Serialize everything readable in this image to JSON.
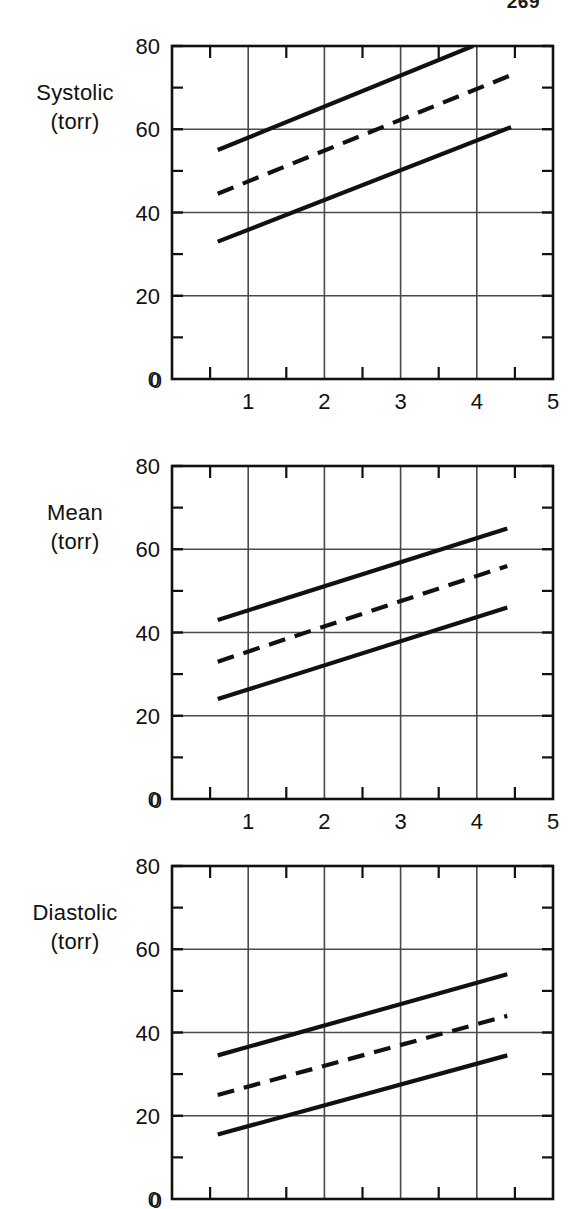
{
  "page": {
    "number": "269"
  },
  "figure": {
    "panel_count": 3
  },
  "chart_data": [
    {
      "type": "line",
      "title": "Systolic",
      "ylabel_lines": [
        "Systolic",
        "(torr)"
      ],
      "ylabel": "Systolic (torr)",
      "xlabel": "",
      "xlim": [
        0,
        5
      ],
      "ylim": [
        0,
        80
      ],
      "xticks": [
        0,
        1,
        2,
        3,
        4,
        5
      ],
      "xtick_labels": [
        "0",
        "1",
        "2",
        "3",
        "4",
        "5"
      ],
      "xminor_ticks": [
        0.5,
        1.5,
        2.5,
        3.5,
        4.5
      ],
      "yticks": [
        0,
        20,
        40,
        60,
        80
      ],
      "ytick_labels": [
        "0",
        "20",
        "40",
        "60",
        "80"
      ],
      "yminor_ticks": [
        10,
        30,
        50,
        70
      ],
      "grid": true,
      "legend": "none",
      "series": [
        {
          "name": "upper-limit",
          "style": "solid",
          "x": [
            0.6,
            3.95
          ],
          "values": [
            55,
            80
          ]
        },
        {
          "name": "mean-regression",
          "style": "dashed",
          "x": [
            0.6,
            4.45
          ],
          "values": [
            44.5,
            73
          ]
        },
        {
          "name": "lower-limit",
          "style": "solid",
          "x": [
            0.6,
            4.45
          ],
          "values": [
            33,
            60.5
          ]
        }
      ]
    },
    {
      "type": "line",
      "title": "Mean",
      "ylabel_lines": [
        "Mean",
        "(torr)"
      ],
      "ylabel": "Mean (torr)",
      "xlabel": "",
      "xlim": [
        0,
        5
      ],
      "ylim": [
        0,
        80
      ],
      "xticks": [
        0,
        1,
        2,
        3,
        4,
        5
      ],
      "xtick_labels": [
        "0",
        "1",
        "2",
        "3",
        "4",
        "5"
      ],
      "xminor_ticks": [
        0.5,
        1.5,
        2.5,
        3.5,
        4.5
      ],
      "yticks": [
        0,
        20,
        40,
        60,
        80
      ],
      "ytick_labels": [
        "0",
        "20",
        "40",
        "60",
        "80"
      ],
      "yminor_ticks": [
        10,
        30,
        50,
        70
      ],
      "grid": true,
      "legend": "none",
      "series": [
        {
          "name": "upper-limit",
          "style": "solid",
          "x": [
            0.6,
            4.4
          ],
          "values": [
            43,
            65
          ]
        },
        {
          "name": "mean-regression",
          "style": "dashed",
          "x": [
            0.6,
            4.4
          ],
          "values": [
            33,
            56
          ]
        },
        {
          "name": "lower-limit",
          "style": "solid",
          "x": [
            0.6,
            4.4
          ],
          "values": [
            24,
            46
          ]
        }
      ]
    },
    {
      "type": "line",
      "title": "Diastolic",
      "ylabel_lines": [
        "Diastolic",
        "(torr)"
      ],
      "ylabel": "Diastolic (torr)",
      "xlabel": "",
      "xlim": [
        0,
        5
      ],
      "ylim": [
        0,
        80
      ],
      "xticks": [
        0,
        1,
        2,
        3,
        4,
        5
      ],
      "xtick_labels": [
        "0",
        "1",
        "2",
        "3",
        "4",
        "5"
      ],
      "xminor_ticks": [
        0.5,
        1.5,
        2.5,
        3.5,
        4.5
      ],
      "yticks": [
        0,
        20,
        40,
        60,
        80
      ],
      "ytick_labels": [
        "0",
        "20",
        "40",
        "60",
        "80"
      ],
      "yminor_ticks": [
        10,
        30,
        50,
        70
      ],
      "grid": true,
      "legend": "none",
      "series": [
        {
          "name": "upper-limit",
          "style": "solid",
          "x": [
            0.6,
            4.4
          ],
          "values": [
            34.5,
            54
          ]
        },
        {
          "name": "mean-regression",
          "style": "dashed",
          "x": [
            0.6,
            4.4
          ],
          "values": [
            25,
            44
          ]
        },
        {
          "name": "lower-limit",
          "style": "solid",
          "x": [
            0.6,
            4.4
          ],
          "values": [
            15.5,
            34.5
          ]
        }
      ]
    }
  ],
  "style": {
    "ink": "#111111",
    "grid_color": "#4a4a4a",
    "background": "#ffffff"
  },
  "layout": {
    "panels": [
      {
        "top": 0,
        "height": 420,
        "plot_left": 172,
        "plot_top": 46,
        "plot_width": 381,
        "plot_height": 333,
        "label_top": 78
      },
      {
        "top": 420,
        "height": 400,
        "plot_left": 172,
        "plot_top": 46,
        "plot_width": 381,
        "plot_height": 333,
        "label_top": 78
      },
      {
        "top": 820,
        "height": 389,
        "plot_left": 172,
        "plot_top": 46,
        "plot_width": 381,
        "plot_height": 333,
        "label_top": 78
      }
    ]
  }
}
